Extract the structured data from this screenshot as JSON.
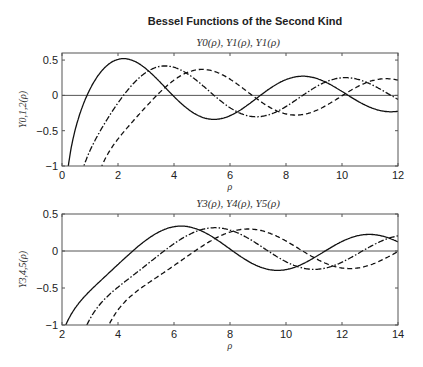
{
  "title": "Bessel Functions of the Second Kind",
  "chart_data": [
    {
      "type": "line",
      "title": "Y0(ρ), Y1(ρ), Y1(ρ)",
      "xlabel": "ρ",
      "ylabel": "Y0,1,2(ρ)",
      "xlim": [
        0,
        12
      ],
      "ylim": [
        -1,
        0.6
      ],
      "xticks": [
        "0",
        "2",
        "4",
        "6",
        "8",
        "10",
        "12"
      ],
      "yticks": [
        "-1",
        "-0.5",
        "0",
        "0.5"
      ],
      "series": [
        {
          "name": "Y0",
          "style": "solid",
          "order": 0
        },
        {
          "name": "Y1",
          "style": "dashdot",
          "order": 1
        },
        {
          "name": "Y2",
          "style": "dashed",
          "order": 2
        }
      ]
    },
    {
      "type": "line",
      "title": "Y3(ρ), Y4(ρ), Y5(ρ)",
      "xlabel": "ρ",
      "ylabel": "Y3,4,5(ρ)",
      "xlim": [
        2,
        14
      ],
      "ylim": [
        -1,
        0.5
      ],
      "xticks": [
        "2",
        "4",
        "6",
        "8",
        "10",
        "12",
        "14"
      ],
      "yticks": [
        "-1",
        "-0.5",
        "0",
        "0.5"
      ],
      "series": [
        {
          "name": "Y3",
          "style": "solid",
          "order": 3
        },
        {
          "name": "Y4",
          "style": "dashdot",
          "order": 4
        },
        {
          "name": "Y5",
          "style": "dashed",
          "order": 5
        }
      ]
    }
  ]
}
